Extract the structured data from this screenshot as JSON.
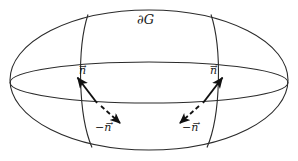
{
  "figure": {
    "kind": "diagram",
    "canvas": {
      "width": 298,
      "height": 161,
      "background": "#ffffff"
    },
    "stroke_color": "#2b2b2b",
    "text_color": "#1a1a1a",
    "labels": {
      "boundary": "∂G",
      "normal_outward_left": "n",
      "normal_outward_right": "n",
      "normal_inward_left": "−n",
      "normal_inward_right": "−n",
      "vector_accent": "→"
    },
    "shapes": {
      "outer_ellipse": {
        "cx": 149,
        "cy": 80,
        "rx": 139,
        "ry": 70
      },
      "equator_ellipse": {
        "cx": 149,
        "cy": 82.5,
        "rx": 139,
        "ry": 20.5
      },
      "meridians": [
        {
          "name": "meridian-left",
          "x_top": 88,
          "x_bottom": 91
        },
        {
          "name": "meridian-right",
          "x_top": 211,
          "x_bottom": 208
        }
      ]
    },
    "vectors": [
      {
        "name": "outward-normal-left",
        "style": "solid",
        "from": [
          97,
          103
        ],
        "to": [
          76,
          76
        ],
        "label": "n",
        "label_at": [
          79,
          65
        ]
      },
      {
        "name": "inward-normal-left",
        "style": "dashed",
        "from": [
          101,
          106
        ],
        "to": [
          122,
          125
        ],
        "label": "−n",
        "label_at": [
          95,
          122
        ]
      },
      {
        "name": "outward-normal-right",
        "style": "solid",
        "from": [
          203,
          103
        ],
        "to": [
          224,
          76
        ],
        "label": "n",
        "label_at": [
          210,
          65
        ]
      },
      {
        "name": "inward-normal-right",
        "style": "dashed",
        "from": [
          199,
          106
        ],
        "to": [
          178,
          125
        ],
        "label": "−n",
        "label_at": [
          182,
          122
        ]
      }
    ]
  }
}
